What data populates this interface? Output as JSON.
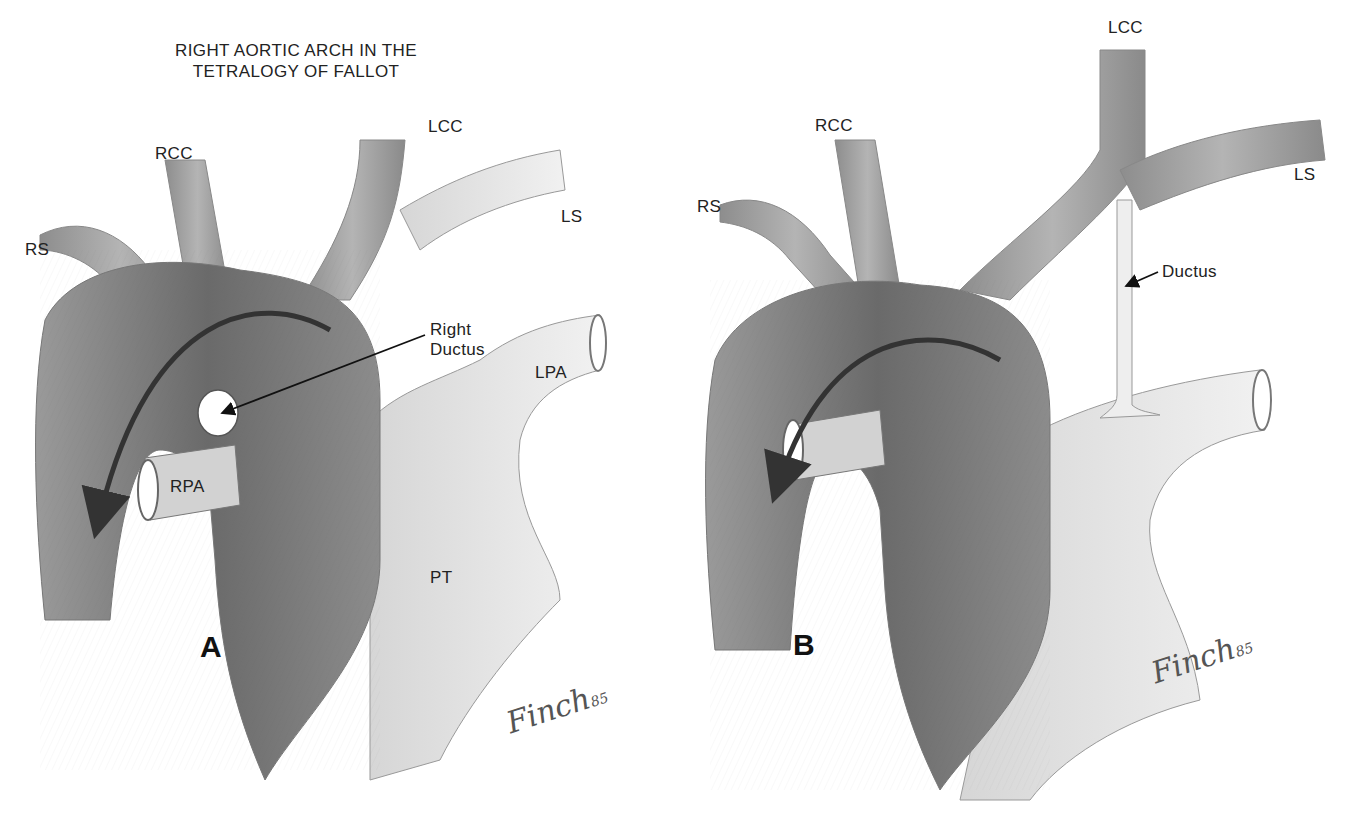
{
  "figure": {
    "title_line1": "RIGHT AORTIC ARCH IN THE",
    "title_line2": "TETRALOGY OF FALLOT"
  },
  "panel_a": {
    "letter": "A",
    "labels": {
      "rs": "RS",
      "rcc": "RCC",
      "lcc": "LCC",
      "ls": "LS",
      "right_ductus_line1": "Right",
      "right_ductus_line2": "Ductus",
      "rpa": "RPA",
      "lpa": "LPA",
      "pt": "PT"
    },
    "signature": "Finch",
    "signature_year": "85"
  },
  "panel_b": {
    "letter": "B",
    "labels": {
      "rs": "RS",
      "rcc": "RCC",
      "lcc": "LCC",
      "ls": "LS",
      "ductus": "Ductus"
    },
    "signature": "Finch",
    "signature_year": "85"
  },
  "colors": {
    "background": "#ffffff",
    "vessel_dark": "#6e6e6e",
    "vessel_mid": "#a8a8a8",
    "vessel_light": "#e2e2e2",
    "ink": "#1a1a1a"
  }
}
